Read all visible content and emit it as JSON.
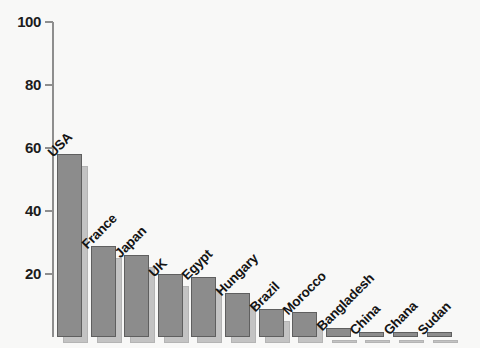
{
  "chart_data": {
    "type": "bar",
    "title": "",
    "subtitle": "",
    "xlabel": "",
    "ylabel": "",
    "ylim": [
      0,
      100
    ],
    "yticks": [
      0,
      20,
      40,
      60,
      80,
      100
    ],
    "ytick_labels": [
      "20",
      "40",
      "60",
      "80",
      "100"
    ],
    "grid": false,
    "legend": null,
    "categories": [
      "USA",
      "France",
      "Japan",
      "UK",
      "Egypt",
      "Hungary",
      "Brazil",
      "Morocco",
      "Bangladesh",
      "China",
      "Ghana",
      "Sudan"
    ],
    "values": [
      58,
      29,
      26,
      20,
      19,
      14,
      9,
      8,
      3,
      1.5,
      1.5,
      1.5
    ],
    "bar_color": "#8c8c8c",
    "bar_edge_color": "#5f5f5f",
    "bar_shadow_color": "#c3c3c3",
    "axis_color": "#8e8e8e",
    "text_color": "#141414",
    "background_color": "#f8f8f7"
  },
  "axis": {
    "ticks": [
      {
        "label": "100",
        "value": 100
      },
      {
        "label": "80",
        "value": 80
      },
      {
        "label": "60",
        "value": 60
      },
      {
        "label": "40",
        "value": 40
      },
      {
        "label": "20",
        "value": 20
      }
    ]
  }
}
